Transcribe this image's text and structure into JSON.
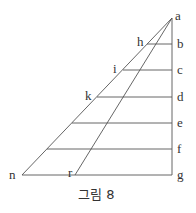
{
  "diagram": {
    "caption": "그림 8",
    "labels": {
      "a": "a",
      "b": "b",
      "c": "c",
      "d": "d",
      "e": "e",
      "f": "f",
      "g": "g",
      "h": "h",
      "i": "i",
      "k": "k",
      "n": "n",
      "r": "r"
    },
    "points": {
      "a": [
        172,
        18
      ],
      "g": [
        172,
        175
      ],
      "n": [
        22,
        175
      ],
      "r": [
        75,
        175
      ]
    },
    "horizontal_levels": [
      {
        "name": "b",
        "y": 44,
        "x_start": 147
      },
      {
        "name": "c",
        "y": 70,
        "x_start": 123
      },
      {
        "name": "d",
        "y": 97,
        "x_start": 97
      },
      {
        "name": "e",
        "y": 123,
        "x_start": 72
      },
      {
        "name": "f",
        "y": 149,
        "x_start": 47
      },
      {
        "name": "g",
        "y": 175,
        "x_start": 22
      }
    ],
    "colors": {
      "line": "#555555",
      "text": "#333333",
      "background": "#ffffff"
    }
  }
}
